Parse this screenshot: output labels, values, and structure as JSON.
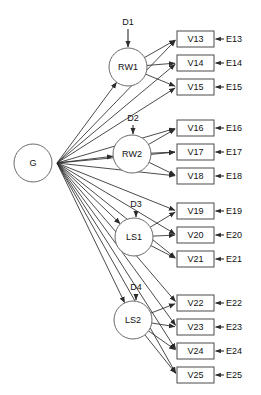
{
  "figure": {
    "type": "sem-path-diagram",
    "title": "",
    "general_factor": {
      "id": "G",
      "label": "G",
      "cx": 33,
      "cy": 163,
      "r": 19
    },
    "factors": [
      {
        "id": "RW1",
        "label": "RW1",
        "cx": 128,
        "cy": 67,
        "r": 19,
        "disturbance": "D1",
        "dx": 128,
        "dy": 23
      },
      {
        "id": "RW2",
        "label": "RW2",
        "cx": 132,
        "cy": 154,
        "r": 19,
        "disturbance": "D2",
        "dx": 133,
        "dy": 119
      },
      {
        "id": "LS1",
        "label": "LS1",
        "cx": 134,
        "cy": 237,
        "r": 19,
        "disturbance": "D3",
        "dx": 136,
        "dy": 205
      },
      {
        "id": "LS2",
        "label": "LS2",
        "cx": 133,
        "cy": 320,
        "r": 19,
        "disturbance": "D4",
        "dx": 136,
        "dy": 288
      }
    ],
    "indicators": [
      {
        "id": "V13",
        "label": "V13",
        "error": "E13",
        "x": 177,
        "y": 31,
        "w": 37,
        "h": 16,
        "factor": "RW1"
      },
      {
        "id": "V14",
        "label": "V14",
        "error": "E14",
        "x": 177,
        "y": 55,
        "w": 37,
        "h": 16,
        "factor": "RW1"
      },
      {
        "id": "V15",
        "label": "V15",
        "error": "E15",
        "x": 177,
        "y": 79,
        "w": 37,
        "h": 16,
        "factor": "RW1"
      },
      {
        "id": "V16",
        "label": "V16",
        "error": "E16",
        "x": 177,
        "y": 120,
        "w": 37,
        "h": 16,
        "factor": "RW2"
      },
      {
        "id": "V17",
        "label": "V17",
        "error": "E17",
        "x": 177,
        "y": 144,
        "w": 37,
        "h": 16,
        "factor": "RW2"
      },
      {
        "id": "V18",
        "label": "V18",
        "error": "E18",
        "x": 177,
        "y": 168,
        "w": 37,
        "h": 16,
        "factor": "RW2"
      },
      {
        "id": "V19",
        "label": "V19",
        "error": "E19",
        "x": 177,
        "y": 203,
        "w": 37,
        "h": 16,
        "factor": "LS1"
      },
      {
        "id": "V20",
        "label": "V20",
        "error": "E20",
        "x": 177,
        "y": 227,
        "w": 37,
        "h": 16,
        "factor": "LS1"
      },
      {
        "id": "V21",
        "label": "V21",
        "error": "E21",
        "x": 177,
        "y": 251,
        "w": 37,
        "h": 16,
        "factor": "LS1"
      },
      {
        "id": "V22",
        "label": "V22",
        "error": "E22",
        "x": 177,
        "y": 295,
        "w": 37,
        "h": 16,
        "factor": "LS2"
      },
      {
        "id": "V23",
        "label": "V23",
        "error": "E23",
        "x": 177,
        "y": 319,
        "w": 37,
        "h": 16,
        "factor": "LS2"
      },
      {
        "id": "V24",
        "label": "V24",
        "error": "E24",
        "x": 177,
        "y": 343,
        "w": 37,
        "h": 16,
        "factor": "LS2"
      },
      {
        "id": "V25",
        "label": "V25",
        "error": "E25",
        "x": 177,
        "y": 367,
        "w": 37,
        "h": 16,
        "factor": "LS2"
      }
    ],
    "colors": {
      "background": "#ffffff",
      "stroke": "#2b2b2b",
      "circle_stroke": "#6a6a6a",
      "box_stroke": "#4a4a4a",
      "text": "#111111"
    }
  }
}
